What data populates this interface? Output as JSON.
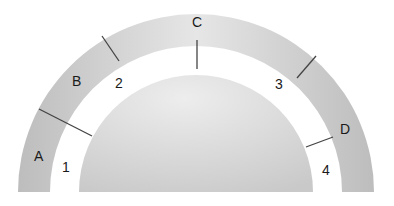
{
  "diagram": {
    "outer_band_labels": [
      {
        "id": "A",
        "text": "A"
      },
      {
        "id": "B",
        "text": "B"
      },
      {
        "id": "C",
        "text": "C"
      },
      {
        "id": "D",
        "text": "D"
      }
    ],
    "inner_gap_labels": [
      {
        "id": "1",
        "text": "1"
      },
      {
        "id": "2",
        "text": "2"
      },
      {
        "id": "3",
        "text": "3"
      },
      {
        "id": "4",
        "text": "4"
      }
    ],
    "colors": {
      "outer_band": "#d2d2d2",
      "inner_dome": "#d9d9d9",
      "divider_line": "#444444",
      "background": "#ffffff"
    }
  }
}
